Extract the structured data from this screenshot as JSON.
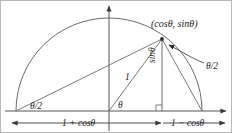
{
  "figure": {
    "stroke_color": "#555555",
    "text_color": "#1a1a1a",
    "background": "#ffffff"
  },
  "labels": {
    "point": "(cosθ, sinθ)",
    "angle_half_right": "θ/2",
    "angle_half_left": "θ/2",
    "angle_theta": "θ",
    "radius": "1",
    "opposite": "sinθ",
    "dimension_left": "1 + cosθ",
    "dimension_right": "1 − cosθ"
  },
  "geometry": {
    "origin": [
      108,
      110
    ],
    "radius_px": 93,
    "left_vertex": [
      15,
      110
    ],
    "right_vertex": [
      201,
      110
    ],
    "point": [
      161,
      38
    ],
    "foot": [
      161,
      110
    ],
    "x_axis_y": 110,
    "y_axis_x": 108,
    "theta_degrees": 52
  }
}
